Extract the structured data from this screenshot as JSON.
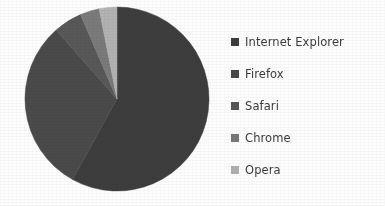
{
  "chart_data": {
    "type": "pie",
    "title": "",
    "subtitle": "",
    "xlabel": "",
    "ylabel": "",
    "grid": false,
    "legend_position": "right",
    "start_angle_deg": 0,
    "direction": "clockwise",
    "categories": [
      "Internet Explorer",
      "Firefox",
      "Safari",
      "Chrome",
      "Opera"
    ],
    "values": [
      58.0,
      30.5,
      5.0,
      3.4,
      3.1
    ],
    "units": "percent",
    "slices": [
      {
        "label": "Internet Explorer",
        "value": 58.0,
        "angle_deg": 208.8,
        "start_deg": 0.0,
        "end_deg": 208.8,
        "color": "#3d3d3d",
        "swatch_color": "#3d3d3d"
      },
      {
        "label": "Firefox",
        "value": 30.5,
        "angle_deg": 109.8,
        "start_deg": 208.8,
        "end_deg": 318.6,
        "color": "#4a4a4a",
        "swatch_color": "#474747"
      },
      {
        "label": "Safari",
        "value": 5.0,
        "angle_deg": 18.0,
        "start_deg": 318.6,
        "end_deg": 336.6,
        "color": "#585858",
        "swatch_color": "#565656"
      },
      {
        "label": "Chrome",
        "value": 3.4,
        "angle_deg": 12.2,
        "start_deg": 336.6,
        "end_deg": 348.8,
        "color": "#7a7a7a",
        "swatch_color": "#787878"
      },
      {
        "label": "Opera",
        "value": 3.1,
        "angle_deg": 11.2,
        "start_deg": 348.8,
        "end_deg": 360.0,
        "color": "#b2b2b2",
        "swatch_color": "#b0b0b0"
      }
    ],
    "geometry": {
      "center_x": 117,
      "center_y": 99,
      "radius": 92
    }
  },
  "legend": {
    "items": [
      {
        "label": "Internet Explorer",
        "color": "#3d3d3d"
      },
      {
        "label": "Firefox",
        "color": "#474747"
      },
      {
        "label": "Safari",
        "color": "#565656"
      },
      {
        "label": "Chrome",
        "color": "#787878"
      },
      {
        "label": "Opera",
        "color": "#b0b0b0"
      }
    ]
  },
  "colors": {
    "background": "#fdfdfd",
    "text": "#3c3c3c"
  }
}
